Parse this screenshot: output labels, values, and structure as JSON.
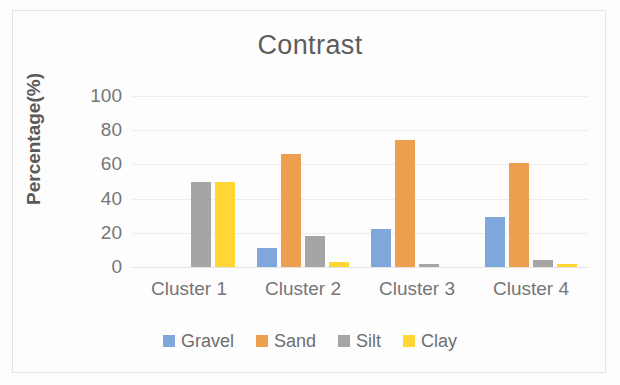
{
  "chart_data": {
    "type": "bar",
    "title": "Contrast",
    "xlabel": "",
    "ylabel": "Percentage(%)",
    "categories": [
      "Cluster 1",
      "Cluster 2",
      "Cluster 3",
      "Cluster 4"
    ],
    "series": [
      {
        "name": "Gravel",
        "color": "#7FA7DC",
        "values": [
          0,
          11,
          22,
          29
        ]
      },
      {
        "name": "Sand",
        "color": "#ED9E4E",
        "values": [
          0,
          66,
          74,
          61
        ]
      },
      {
        "name": "Silt",
        "color": "#A5A5A5",
        "values": [
          50,
          18,
          2,
          4
        ]
      },
      {
        "name": "Clay",
        "color": "#FFD633",
        "values": [
          50,
          3,
          0,
          2
        ]
      }
    ],
    "ylim": [
      0,
      100
    ],
    "yticks": [
      0,
      20,
      40,
      60,
      80,
      100
    ],
    "ytick_labels": [
      "0",
      "20",
      "40",
      "60",
      "80",
      "100"
    ],
    "grid": true,
    "legend_position": "bottom"
  }
}
